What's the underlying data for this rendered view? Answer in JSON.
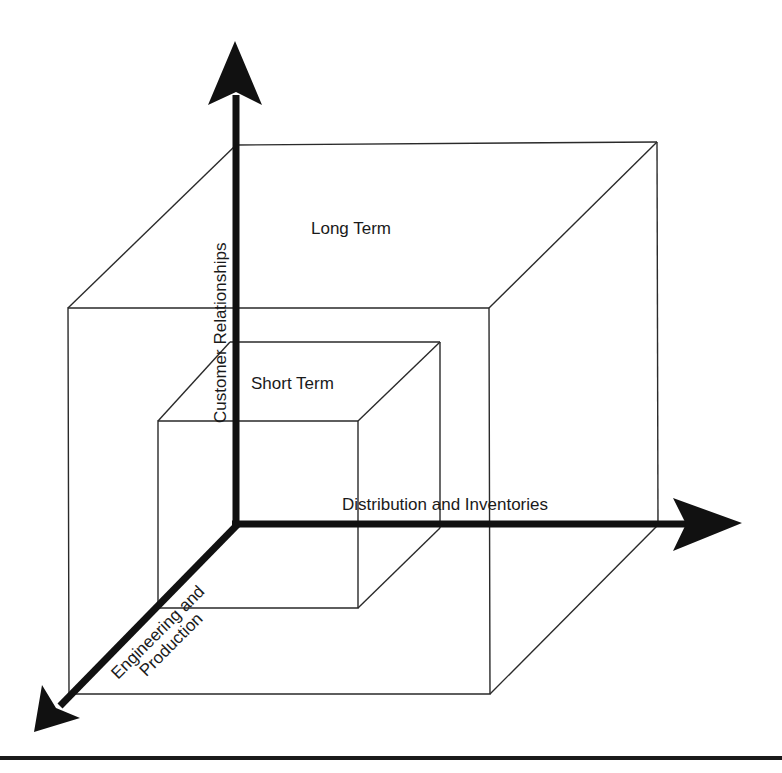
{
  "diagram": {
    "type": "3d-nested-cubes",
    "colors": {
      "background": "#ffffff",
      "lines": "#2a2a2a",
      "axes": "#111111",
      "text": "#1a1a1a"
    },
    "axes": {
      "vertical": {
        "label": "Customer Relationships",
        "direction": "up"
      },
      "horizontal": {
        "label": "Distribution and Inventories",
        "direction": "right"
      },
      "diagonal": {
        "label_line1": "Engineering and",
        "label_line2": "Production",
        "direction": "down-left"
      }
    },
    "regions": {
      "outer_cube": {
        "label": "Long Term"
      },
      "inner_cube": {
        "label": "Short Term"
      }
    }
  }
}
